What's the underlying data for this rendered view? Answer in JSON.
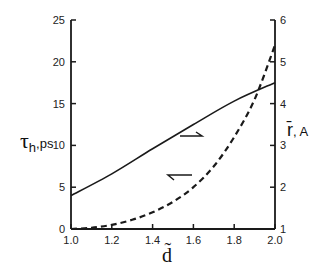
{
  "chart_data": {
    "type": "line",
    "title": "",
    "xlabel": "d̃",
    "ylabel_left": "τh, ps",
    "ylabel_right": "r̄, A",
    "xlim": [
      1.0,
      2.0
    ],
    "ylim_left": [
      0,
      25
    ],
    "ylim_right": [
      1,
      6
    ],
    "x_ticks": [
      "1.0",
      "1.2",
      "1.4",
      "1.6",
      "1.8",
      "2.0"
    ],
    "y_left_ticks": [
      "0",
      "5",
      "10",
      "15",
      "20",
      "25"
    ],
    "y_right_ticks": [
      "1",
      "2",
      "3",
      "4",
      "5",
      "6"
    ],
    "grid": false,
    "legend": "none (arrows indicate axis per curve)",
    "series": [
      {
        "name": "τh",
        "axis": "left",
        "style": "solid",
        "x": [
          1.0,
          1.2,
          1.4,
          1.6,
          1.8,
          2.0
        ],
        "values": [
          4.0,
          6.6,
          9.6,
          12.5,
          15.3,
          17.5
        ]
      },
      {
        "name": "r̄",
        "axis": "right",
        "style": "dashed",
        "x": [
          1.0,
          1.1,
          1.2,
          1.3,
          1.4,
          1.5,
          1.6,
          1.7,
          1.8,
          1.9,
          2.0
        ],
        "values": [
          1.0,
          1.03,
          1.1,
          1.22,
          1.4,
          1.65,
          2.0,
          2.5,
          3.2,
          4.1,
          5.4
        ]
      }
    ],
    "annotations": [
      {
        "type": "arrow",
        "direction": "right",
        "points_to": "right axis (r̄)",
        "near_series": "τh"
      },
      {
        "type": "arrow",
        "direction": "left",
        "points_to": "left axis (τh)",
        "near_series": "r̄"
      }
    ]
  },
  "labels": {
    "x_title": "d̃",
    "left_title_main": "τ",
    "left_title_sub": "h",
    "left_title_unit": ",ps",
    "right_title_main": "r̄",
    "right_title_unit": ", A"
  }
}
